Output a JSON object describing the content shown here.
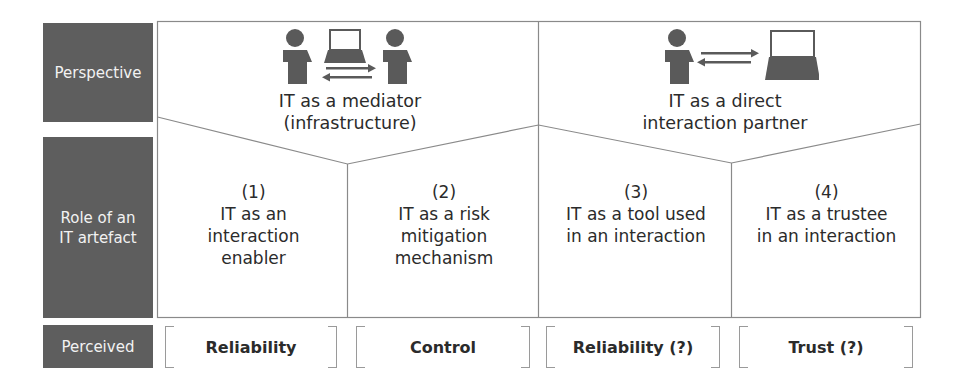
{
  "row_labels": {
    "perspective": "Perspective",
    "role": [
      "Role of an",
      "IT artefact"
    ],
    "perceived": "Perceived"
  },
  "perspectives": [
    {
      "line1": "IT as a mediator",
      "line2": "(infrastructure)",
      "icon": "person-laptop-person-icon"
    },
    {
      "line1": "IT as a direct",
      "line2": "interaction partner",
      "icon": "person-exchange-laptop-icon"
    }
  ],
  "roles": [
    {
      "num": "(1)",
      "lines": [
        "IT as an",
        "interaction",
        "enabler"
      ]
    },
    {
      "num": "(2)",
      "lines": [
        "IT as a risk",
        "mitigation",
        "mechanism"
      ]
    },
    {
      "num": "(3)",
      "lines": [
        "IT as a tool used",
        "in an interaction"
      ]
    },
    {
      "num": "(4)",
      "lines": [
        "IT as a trustee",
        "in an interaction"
      ]
    }
  ],
  "perceived": [
    "Reliability",
    "Control",
    "Reliability (?)",
    "Trust (?)"
  ],
  "colors": {
    "label_bg": "#5e5e5e",
    "line": "#8a8a8a",
    "icon": "#5a5a5a"
  }
}
